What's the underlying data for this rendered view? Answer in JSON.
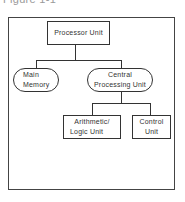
{
  "figure": {
    "title": "Figure 1-1"
  },
  "diagram": {
    "root": {
      "label": "Processor Unit"
    },
    "children": [
      {
        "label_line1": "Main",
        "label_line2": "Memory"
      },
      {
        "label_line1": "Central",
        "label_line2": "Processing Unit"
      }
    ],
    "cpu_children": [
      {
        "label_line1": "Arithmetic/",
        "label_line2": "Logic Unit"
      },
      {
        "label_line1": "Control",
        "label_line2": "Unit"
      }
    ]
  }
}
